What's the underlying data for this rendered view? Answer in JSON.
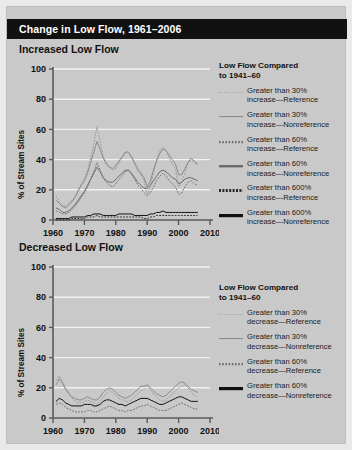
{
  "figure": {
    "title": "Change in Low Flow, 1961–2006",
    "background_color": "#c9c9c9",
    "title_bar_color": "#111111",
    "title_text_color": "#ffffff"
  },
  "panels": [
    {
      "heading": "Increased Low Flow",
      "y_axis_label": "% of Stream Sites",
      "legend_title_line1": "Low Flow Compared",
      "legend_title_line2": "to 1941–60",
      "legend": [
        {
          "label_line1": "Greater than 30%",
          "label_line2": "increase—Reference",
          "style": "dotted",
          "weight": 0.9,
          "color": "#9a9a9a"
        },
        {
          "label_line1": "Greater than 30%",
          "label_line2": "increase—Nonreference",
          "style": "solid",
          "weight": 1.1,
          "color": "#8a8a8a"
        },
        {
          "label_line1": "Greater than 60%",
          "label_line2": "increase—Reference",
          "style": "dotted",
          "weight": 2.2,
          "color": "#6f6f6f"
        },
        {
          "label_line1": "Greater than 60%",
          "label_line2": "increase—Nonreference",
          "style": "solid",
          "weight": 2.4,
          "color": "#6b6b6b"
        },
        {
          "label_line1": "Greater than 600%",
          "label_line2": "increase—Reference",
          "style": "dotted",
          "weight": 3.0,
          "color": "#2a2a2a"
        },
        {
          "label_line1": "Greater than 600%",
          "label_line2": "increase—Nonreference",
          "style": "solid",
          "weight": 3.2,
          "color": "#111111"
        }
      ]
    },
    {
      "heading": "Decreased Low Flow",
      "y_axis_label": "% of Stream Sites",
      "legend_title_line1": "Low Flow Compared",
      "legend_title_line2": "to 1941–60",
      "legend": [
        {
          "label_line1": "Greater than 30%",
          "label_line2": "decrease—Reference",
          "style": "dotted",
          "weight": 0.9,
          "color": "#9a9a9a"
        },
        {
          "label_line1": "Greater than 30%",
          "label_line2": "decrease—Nonreference",
          "style": "solid",
          "weight": 1.1,
          "color": "#8a8a8a"
        },
        {
          "label_line1": "Greater than 60%",
          "label_line2": "decrease—Reference",
          "style": "dotted",
          "weight": 2.2,
          "color": "#6f6f6f"
        },
        {
          "label_line1": "Greater than 60%",
          "label_line2": "decrease—Nonreference",
          "style": "solid",
          "weight": 3.2,
          "color": "#111111"
        }
      ]
    }
  ],
  "chart_data": [
    {
      "type": "line",
      "title": "Increased Low Flow",
      "xlabel": "",
      "ylabel": "% of Stream Sites",
      "xlim": [
        1960,
        2010
      ],
      "ylim": [
        0,
        100
      ],
      "xticks": [
        1960,
        1970,
        1980,
        1990,
        2000,
        2010
      ],
      "yticks": [
        0,
        20,
        40,
        60,
        80,
        100
      ],
      "grid": "horizontal",
      "legend_position": "right",
      "x": [
        1961,
        1962,
        1963,
        1964,
        1965,
        1966,
        1967,
        1968,
        1969,
        1970,
        1971,
        1972,
        1973,
        1974,
        1975,
        1976,
        1977,
        1978,
        1979,
        1980,
        1981,
        1982,
        1983,
        1984,
        1985,
        1986,
        1987,
        1988,
        1989,
        1990,
        1991,
        1992,
        1993,
        1994,
        1995,
        1996,
        1997,
        1998,
        1999,
        2000,
        2001,
        2002,
        2003,
        2004,
        2005,
        2006
      ],
      "series": [
        {
          "name": "Greater than 30% increase—Reference",
          "style": "dotted",
          "color": "#9a9a9a",
          "values": [
            16,
            12,
            10,
            9,
            11,
            13,
            15,
            20,
            24,
            27,
            33,
            41,
            50,
            62,
            52,
            42,
            38,
            35,
            33,
            34,
            38,
            41,
            44,
            45,
            41,
            37,
            32,
            30,
            26,
            17,
            22,
            31,
            40,
            46,
            48,
            46,
            41,
            37,
            34,
            22,
            25,
            31,
            38,
            40,
            38,
            37
          ]
        },
        {
          "name": "Greater than 30% increase—Nonreference",
          "style": "solid",
          "color": "#8a8a8a",
          "values": [
            13,
            11,
            9,
            8,
            10,
            12,
            15,
            19,
            23,
            26,
            31,
            38,
            45,
            52,
            47,
            41,
            37,
            35,
            34,
            36,
            39,
            42,
            45,
            45,
            42,
            38,
            34,
            31,
            28,
            22,
            26,
            33,
            39,
            44,
            47,
            46,
            43,
            40,
            37,
            30,
            30,
            34,
            38,
            41,
            39,
            37
          ]
        },
        {
          "name": "Greater than 60% increase—Reference",
          "style": "dotted",
          "color": "#6f6f6f",
          "values": [
            6,
            5,
            4,
            4,
            5,
            7,
            9,
            12,
            15,
            18,
            22,
            27,
            32,
            38,
            33,
            28,
            25,
            23,
            22,
            24,
            27,
            29,
            32,
            33,
            30,
            27,
            23,
            21,
            18,
            16,
            18,
            22,
            26,
            29,
            31,
            29,
            26,
            24,
            22,
            17,
            18,
            22,
            25,
            26,
            24,
            23
          ]
        },
        {
          "name": "Greater than 60% increase—Nonreference",
          "style": "solid",
          "color": "#6b6b6b",
          "values": [
            8,
            7,
            5,
            5,
            6,
            8,
            10,
            13,
            16,
            19,
            23,
            27,
            31,
            35,
            32,
            28,
            26,
            25,
            25,
            27,
            29,
            31,
            33,
            33,
            31,
            28,
            25,
            23,
            21,
            21,
            23,
            26,
            29,
            32,
            33,
            32,
            30,
            28,
            27,
            24,
            25,
            27,
            28,
            28,
            27,
            26
          ]
        },
        {
          "name": "Greater than 600% increase—Reference",
          "style": "dotted",
          "color": "#2a2a2a",
          "values": [
            0,
            0,
            0,
            0,
            0,
            1,
            1,
            1,
            1,
            1,
            2,
            2,
            2,
            3,
            2,
            2,
            2,
            2,
            2,
            2,
            2,
            2,
            2,
            2,
            2,
            2,
            2,
            2,
            1,
            1,
            2,
            2,
            3,
            3,
            3,
            3,
            3,
            3,
            3,
            3,
            3,
            3,
            3,
            3,
            3,
            3
          ]
        },
        {
          "name": "Greater than 600% increase—Nonreference",
          "style": "solid",
          "color": "#111111",
          "values": [
            1,
            1,
            1,
            1,
            1,
            2,
            2,
            2,
            2,
            2,
            3,
            3,
            4,
            4,
            4,
            3,
            3,
            3,
            3,
            3,
            4,
            4,
            4,
            4,
            4,
            3,
            3,
            3,
            3,
            3,
            4,
            4,
            5,
            5,
            6,
            5,
            5,
            5,
            5,
            5,
            5,
            5,
            5,
            5,
            5,
            5
          ]
        }
      ]
    },
    {
      "type": "line",
      "title": "Decreased Low Flow",
      "xlabel": "",
      "ylabel": "% of Stream Sites",
      "xlim": [
        1960,
        2010
      ],
      "ylim": [
        0,
        100
      ],
      "xticks": [
        1960,
        1970,
        1980,
        1990,
        2000,
        2010
      ],
      "yticks": [
        0,
        20,
        40,
        60,
        80,
        100
      ],
      "grid": "horizontal",
      "legend_position": "right",
      "x": [
        1961,
        1962,
        1963,
        1964,
        1965,
        1966,
        1967,
        1968,
        1969,
        1970,
        1971,
        1972,
        1973,
        1974,
        1975,
        1976,
        1977,
        1978,
        1979,
        1980,
        1981,
        1982,
        1983,
        1984,
        1985,
        1986,
        1987,
        1988,
        1989,
        1990,
        1991,
        1992,
        1993,
        1994,
        1995,
        1996,
        1997,
        1998,
        1999,
        2000,
        2001,
        2002,
        2003,
        2004,
        2005,
        2006
      ],
      "series": [
        {
          "name": "Greater than 30% decrease—Reference",
          "style": "dotted",
          "color": "#9a9a9a",
          "values": [
            25,
            28,
            24,
            20,
            17,
            13,
            11,
            10,
            10,
            11,
            12,
            11,
            10,
            9,
            11,
            14,
            16,
            18,
            17,
            15,
            13,
            12,
            11,
            11,
            12,
            14,
            16,
            18,
            19,
            21,
            19,
            16,
            14,
            12,
            11,
            12,
            14,
            16,
            18,
            20,
            21,
            22,
            20,
            17,
            15,
            14
          ]
        },
        {
          "name": "Greater than 30% decrease—Nonreference",
          "style": "solid",
          "color": "#8a8a8a",
          "values": [
            22,
            26,
            23,
            19,
            16,
            14,
            13,
            12,
            12,
            13,
            14,
            13,
            12,
            12,
            14,
            17,
            19,
            20,
            19,
            17,
            15,
            14,
            13,
            14,
            15,
            17,
            19,
            21,
            21,
            22,
            20,
            18,
            16,
            15,
            14,
            15,
            17,
            19,
            21,
            23,
            24,
            23,
            21,
            19,
            18,
            17
          ]
        },
        {
          "name": "Greater than 60% decrease—Reference",
          "style": "dotted",
          "color": "#6f6f6f",
          "values": [
            9,
            10,
            9,
            7,
            6,
            5,
            4,
            4,
            4,
            4,
            5,
            5,
            4,
            4,
            5,
            6,
            7,
            8,
            7,
            6,
            5,
            5,
            4,
            5,
            5,
            6,
            7,
            8,
            8,
            9,
            8,
            7,
            6,
            5,
            5,
            5,
            6,
            7,
            8,
            9,
            10,
            9,
            8,
            7,
            6,
            6
          ]
        },
        {
          "name": "Greater than 60% decrease—Nonreference",
          "style": "solid",
          "color": "#111111",
          "values": [
            11,
            13,
            12,
            10,
            9,
            8,
            8,
            8,
            8,
            9,
            9,
            9,
            8,
            8,
            9,
            11,
            12,
            12,
            11,
            10,
            9,
            9,
            8,
            9,
            10,
            11,
            12,
            13,
            13,
            13,
            12,
            11,
            10,
            9,
            9,
            10,
            11,
            12,
            13,
            14,
            14,
            13,
            12,
            11,
            11,
            11
          ]
        }
      ]
    }
  ]
}
